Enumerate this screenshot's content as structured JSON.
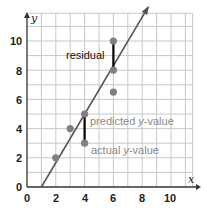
{
  "chart_data": {
    "type": "scatter",
    "title": "",
    "xlabel": "x",
    "ylabel": "y",
    "xlim": [
      0,
      11.5
    ],
    "ylim": [
      0,
      12
    ],
    "grid": true,
    "x_ticks": [
      "0",
      "2",
      "4",
      "6",
      "8",
      "10"
    ],
    "y_ticks": [
      "0",
      "2",
      "4",
      "6",
      "8",
      "10"
    ],
    "points": [
      {
        "x": 2,
        "y": 2
      },
      {
        "x": 3,
        "y": 4
      },
      {
        "x": 4,
        "y": 5
      },
      {
        "x": 4,
        "y": 3
      },
      {
        "x": 6,
        "y": 10
      },
      {
        "x": 6,
        "y": 8
      },
      {
        "x": 6,
        "y": 6.5
      }
    ],
    "line_of_fit": {
      "x0": 1,
      "y0": 0,
      "x1": 8.4,
      "y1": 12.3,
      "arrow": true
    },
    "residual_segments": [
      {
        "x": 6,
        "y_from": 8,
        "y_to": 10
      },
      {
        "x": 4,
        "y_from": 3,
        "y_to": 5
      }
    ],
    "annotations": [
      {
        "text": "residual",
        "x": 5.8,
        "y": 9.1,
        "color": "#111111"
      },
      {
        "text_parts": [
          "predicted ",
          "y",
          "-value"
        ],
        "x": 4.3,
        "y": 4.6,
        "color": "#8a8a8a"
      },
      {
        "text_parts": [
          "actual ",
          "y",
          "-value"
        ],
        "x": 4.3,
        "y": 2.6,
        "color": "#8a8a8a"
      }
    ]
  },
  "labels": {
    "x_axis": "x",
    "y_axis": "y",
    "residual": "residual",
    "predicted_pre": "predicted ",
    "predicted_var": "y",
    "predicted_post": "-value",
    "actual_pre": "actual ",
    "actual_var": "y",
    "actual_post": "-value",
    "tick_x0": "0",
    "tick_x2": "2",
    "tick_x4": "4",
    "tick_x6": "6",
    "tick_x8": "8",
    "tick_x10": "10",
    "tick_y0": "0",
    "tick_y2": "2",
    "tick_y4": "4",
    "tick_y6": "6",
    "tick_y8": "8",
    "tick_y10": "10"
  },
  "colors": {
    "grid": "#c8c8c8",
    "axis": "#333333",
    "line": "#555555",
    "points": "#808080",
    "residual_bar": "#000000",
    "annotation_gray": "#8a8a8a"
  }
}
